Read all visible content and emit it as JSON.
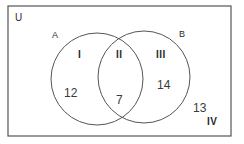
{
  "diagram": {
    "type": "venn",
    "universe_label": "U",
    "sets": [
      {
        "name": "A",
        "label": "A"
      },
      {
        "name": "B",
        "label": "B"
      }
    ],
    "regions": [
      {
        "id": "I",
        "description": "A only",
        "value": "12"
      },
      {
        "id": "II",
        "description": "A and B",
        "value": "7"
      },
      {
        "id": "III",
        "description": "B only",
        "value": "14"
      },
      {
        "id": "IV",
        "description": "neither A nor B",
        "value": "13"
      }
    ],
    "colors": {
      "stroke": "#555555",
      "text": "#2a2a2a",
      "background": "#ffffff"
    }
  }
}
